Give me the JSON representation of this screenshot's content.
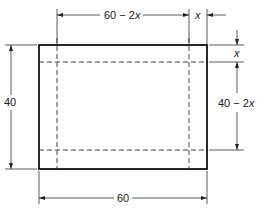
{
  "diagram": {
    "type": "box-from-sheet-cutout",
    "labels": {
      "top_width": "60 − 2",
      "top_width_var": "x",
      "corner_cut_width": "x",
      "corner_cut_height": "x",
      "inner_height": "40 − 2",
      "inner_height_var": "x",
      "outer_height": "40",
      "outer_width": "60"
    },
    "colors": {
      "line": "#111111",
      "text": "#222222",
      "background": "#ffffff"
    }
  }
}
